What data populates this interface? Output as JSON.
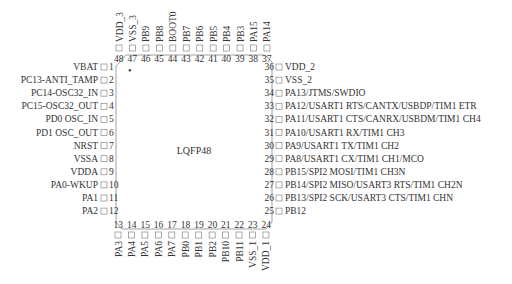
{
  "package": {
    "label": "LQFP48",
    "pin1_marker": "•"
  },
  "left_pins": [
    {
      "num": "1",
      "name": "VBAT"
    },
    {
      "num": "2",
      "name": "PC13-ANTI_TAMP"
    },
    {
      "num": "3",
      "name": "PC14-OSC32_IN"
    },
    {
      "num": "4",
      "name": "PC15-OSC32_OUT"
    },
    {
      "num": "5",
      "name": "PD0 OSC_IN"
    },
    {
      "num": "6",
      "name": "PD1 OSC_OUT"
    },
    {
      "num": "7",
      "name": "NRST"
    },
    {
      "num": "8",
      "name": "VSSA"
    },
    {
      "num": "9",
      "name": "VDDA"
    },
    {
      "num": "10",
      "name": "PA0-WKUP"
    },
    {
      "num": "11",
      "name": "PA1"
    },
    {
      "num": "12",
      "name": "PA2"
    }
  ],
  "bottom_pins": [
    {
      "num": "13",
      "name": "PA3"
    },
    {
      "num": "14",
      "name": "PA4"
    },
    {
      "num": "15",
      "name": "PA5"
    },
    {
      "num": "16",
      "name": "PA6"
    },
    {
      "num": "17",
      "name": "PA7"
    },
    {
      "num": "18",
      "name": "PB0"
    },
    {
      "num": "19",
      "name": "PB1"
    },
    {
      "num": "20",
      "name": "PB2"
    },
    {
      "num": "21",
      "name": "PB10"
    },
    {
      "num": "22",
      "name": "PB11"
    },
    {
      "num": "23",
      "name": "VSS_1"
    },
    {
      "num": "24",
      "name": "VDD_1"
    }
  ],
  "right_pins": [
    {
      "num": "36",
      "name": "VDD_2"
    },
    {
      "num": "35",
      "name": "VSS_2"
    },
    {
      "num": "34",
      "name": "PA13/JTMS/SWDIO"
    },
    {
      "num": "33",
      "name": "PA12/USART1 RTS/CANTX/USBDP/TIM1 ETR"
    },
    {
      "num": "32",
      "name": "PA11/USART1 CTS/CANRX/USBDM/TIM1 CH4"
    },
    {
      "num": "31",
      "name": "PA10/USART1 RX/TIM1 CH3"
    },
    {
      "num": "30",
      "name": "PA9/USART1 TX/TIM1 CH2"
    },
    {
      "num": "29",
      "name": "PA8/USART1 CX/TIM1 CH1/MCO"
    },
    {
      "num": "28",
      "name": "PB15/SPI2 MOSI/TIM1 CH3N"
    },
    {
      "num": "27",
      "name": "PB14/SPI2 MISO/USART3 RTS/TIM1 CH2N"
    },
    {
      "num": "26",
      "name": "PB13/SPI2 SCK/USART3 CTS/TIM1 CHN"
    },
    {
      "num": "25",
      "name": "PB12"
    }
  ],
  "top_pins": [
    {
      "num": "48",
      "name": "VDD_3"
    },
    {
      "num": "47",
      "name": "VSS_3"
    },
    {
      "num": "46",
      "name": "PB9"
    },
    {
      "num": "45",
      "name": "PB8"
    },
    {
      "num": "44",
      "name": "BOOT0"
    },
    {
      "num": "43",
      "name": "PB7"
    },
    {
      "num": "42",
      "name": "PB6"
    },
    {
      "num": "41",
      "name": "PB5"
    },
    {
      "num": "40",
      "name": "PB4"
    },
    {
      "num": "39",
      "name": "PB3"
    },
    {
      "num": "38",
      "name": "PA15"
    },
    {
      "num": "37",
      "name": "PA14"
    }
  ],
  "colors": {
    "line": "#888888",
    "text": "#333333",
    "background": "#ffffff"
  }
}
